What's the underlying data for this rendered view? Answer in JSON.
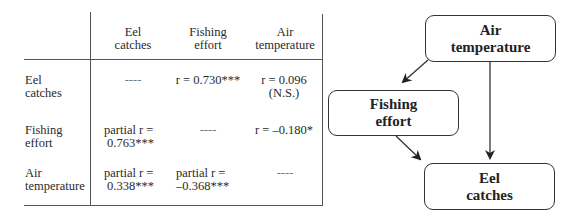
{
  "table": {
    "columns": [
      {
        "line1": "Eel",
        "line2": "catches"
      },
      {
        "line1": "Fishing",
        "line2": "effort"
      },
      {
        "line1": "Air",
        "line2": "temperature"
      }
    ],
    "rows": [
      {
        "label_line1": "Eel",
        "label_line2": "catches",
        "cells": [
          {
            "line1": "----",
            "line2": ""
          },
          {
            "line1": "r = 0.730***",
            "line2": ""
          },
          {
            "line1": "r = 0.096",
            "line2": "(N.S.)"
          }
        ]
      },
      {
        "label_line1": "Fishing",
        "label_line2": "effort",
        "cells": [
          {
            "line1": "partial r =",
            "line2": "0.763***"
          },
          {
            "line1": "----",
            "line2": ""
          },
          {
            "line1": "r = –0.180*",
            "line2": ""
          }
        ]
      },
      {
        "label_line1": "Air",
        "label_line2": "temperature",
        "cells": [
          {
            "line1": "partial r =",
            "line2": "0.338***"
          },
          {
            "line1": "partial r =",
            "line2": "–0.368***"
          },
          {
            "line1": "----",
            "line2": ""
          }
        ]
      }
    ]
  },
  "diagram": {
    "nodes": {
      "air": {
        "line1": "Air",
        "line2": "temperature"
      },
      "fishing": {
        "line1": "Fishing",
        "line2": "effort"
      },
      "eel": {
        "line1": "Eel",
        "line2": "catches"
      }
    },
    "edges": [
      {
        "from": "air",
        "to": "fishing"
      },
      {
        "from": "air",
        "to": "eel"
      },
      {
        "from": "fishing",
        "to": "eel"
      }
    ]
  }
}
